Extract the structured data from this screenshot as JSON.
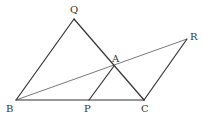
{
  "diagram": {
    "points": {
      "Q": {
        "label": "Q",
        "x": 74,
        "y": 19
      },
      "B": {
        "label": "B",
        "x": 16,
        "y": 100
      },
      "C": {
        "label": "C",
        "x": 144,
        "y": 100
      },
      "R": {
        "label": "R",
        "x": 187,
        "y": 39
      },
      "A": {
        "label": "A",
        "x": 114,
        "y": 66
      },
      "P": {
        "label": "P",
        "x": 89,
        "y": 100
      }
    },
    "segments": [
      [
        "B",
        "Q"
      ],
      [
        "Q",
        "C"
      ],
      [
        "B",
        "C"
      ],
      [
        "B",
        "R"
      ],
      [
        "R",
        "C"
      ],
      [
        "A",
        "P"
      ]
    ]
  }
}
